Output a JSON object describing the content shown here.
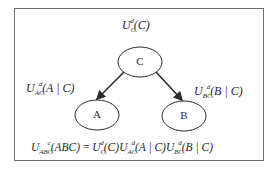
{
  "diagram": {
    "type": "bayesian-network",
    "nodes": [
      {
        "id": "C",
        "label": "C",
        "cx": 140,
        "cy": 62
      },
      {
        "id": "A",
        "label": "A",
        "cx": 97,
        "cy": 115
      },
      {
        "id": "B",
        "label": "B",
        "cx": 184,
        "cy": 116
      }
    ],
    "edges": [
      {
        "from": "C",
        "to": "A"
      },
      {
        "from": "C",
        "to": "B"
      }
    ],
    "labels": {
      "root": {
        "base": "U",
        "sup": "d",
        "sub": "C",
        "arg": "(C)"
      },
      "left": {
        "base": "U",
        "sup": "d",
        "sub": "AC",
        "arg": "(A | C)"
      },
      "right": {
        "base": "U",
        "sup": "d",
        "sub": "BC",
        "arg": "(B | C)"
      }
    },
    "formula": {
      "lhs_base": "U",
      "lhs_sup": "c",
      "lhs_sub": "ABC",
      "lhs_arg": "(ABC)",
      "equals": " = ",
      "t1_base": "U",
      "t1_sup": "d",
      "t1_sub": "C",
      "t1_arg": "(C)",
      "t2_base": "U",
      "t2_sup": "d",
      "t2_sub": "AC",
      "t2_arg": "(A | C)",
      "t3_base": "U",
      "t3_sup": "d",
      "t3_sub": "BC",
      "t3_arg": "(B | C)"
    },
    "colors": {
      "stroke": "#2a2a2a",
      "frame": "#6e6e6e",
      "background": "#ffffff"
    }
  }
}
